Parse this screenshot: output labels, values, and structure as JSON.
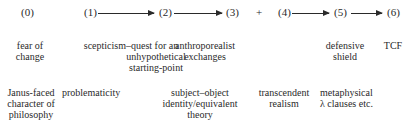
{
  "nodes": [
    {
      "id": "0",
      "label": "(0)"
    },
    {
      "id": "1",
      "label": "(1)"
    },
    {
      "id": "2",
      "label": "(2)"
    },
    {
      "id": "3",
      "label": "(3)"
    },
    {
      "id": "4",
      "label": "(4)"
    },
    {
      "id": "5",
      "label": "(5)"
    },
    {
      "id": "6",
      "label": "(6)"
    }
  ],
  "plus": "+",
  "edges": [
    {
      "from": "1",
      "to": "2"
    },
    {
      "from": "2",
      "to": "3"
    },
    {
      "from": "4",
      "to": "5"
    },
    {
      "from": "5",
      "to": "6"
    }
  ],
  "row1": {
    "n0": [
      "fear of",
      "change"
    ],
    "n1": [
      "scepticism–quest for an",
      "unhypothetical",
      "starting-point"
    ],
    "n2": [
      "anthroporealist",
      "exchanges"
    ],
    "n5": [
      "defensive",
      "shield"
    ],
    "n6": [
      "TCF"
    ]
  },
  "row2": {
    "n0": [
      "Janus-faced",
      "character of",
      "philosophy"
    ],
    "n1": [
      "problematicity"
    ],
    "n2": [
      "subject–object",
      "identity/equivalent",
      "theory"
    ],
    "n4": [
      "transcendent",
      "realism"
    ],
    "n5": [
      "metaphysical",
      "λ clauses etc."
    ]
  }
}
